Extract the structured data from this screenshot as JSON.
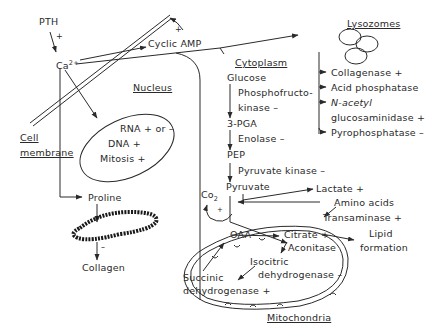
{
  "regions": {
    "cell_membrane_line1": "Cell",
    "cell_membrane_line2": "membrane",
    "nucleus": "Nucleus",
    "cytoplasm": "Cytoplasm",
    "lysozomes": "Lysozomes",
    "mitochondria": "Mitochondria"
  },
  "signaling": {
    "pth": "PTH",
    "pth_sign": "+",
    "calcium": "Ca",
    "calcium_charge": "2+",
    "cyclic_amp": "Cyclic AMP",
    "cyclic_amp_sign": "+"
  },
  "nucleus_items": [
    "RNA + or –",
    "DNA +",
    "Mitosis +"
  ],
  "collagen_path": {
    "proline": "Proline",
    "collagen": "Collagen",
    "collagen_sign": "–"
  },
  "glycolysis": {
    "glucose": "Glucose",
    "pfk_line1": "Phosphofructo-",
    "pfk_line2": "kinase –",
    "pga": "3-PGA",
    "enolase": "Enolase –",
    "pep": "PEP",
    "pyruvate_kinase": "Pyruvate kinase –",
    "pyruvate": "Pyruvate",
    "co2": "Co",
    "co2_sub": "2",
    "co2_sign": "+"
  },
  "lysosomal_enzymes": [
    "Collagenase +",
    "Acid phosphatase",
    "N-acetyl",
    "glucosaminidase +",
    "Pyrophosphatase –"
  ],
  "pyruvate_branches": {
    "lactate": "Lactate +",
    "amino_acids": "Amino acids",
    "transaminase": "Transaminase +",
    "lipid_line1": "Lipid",
    "lipid_line2": "formation"
  },
  "tca_cycle": {
    "oaa": "OAA",
    "citrate": "Citrate +",
    "aconitase": "Aconitase",
    "isocitric_line1": "Isocitric",
    "isocitric_line2": "dehydrogenase –",
    "succinic_line1": "Succinic",
    "succinic_line2": "dehydrogenase +"
  },
  "colors": {
    "ink": "#2a2a2a",
    "background": "#ffffff"
  }
}
